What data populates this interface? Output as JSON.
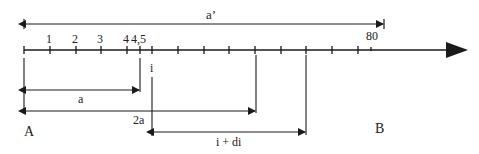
{
  "diagram": {
    "type": "number-line-intervals",
    "axis": {
      "tick_labels": [
        "1",
        "2",
        "3",
        "4",
        "4,5",
        "80"
      ],
      "marker_i": "i"
    },
    "intervals": {
      "a_prime": "a’",
      "a": "a",
      "two_a": "2a",
      "i_plus_di": "i + di"
    },
    "points": {
      "A": "A",
      "B": "B"
    },
    "colors": {
      "stroke": "#1a1a1a",
      "text": "#222222"
    }
  }
}
